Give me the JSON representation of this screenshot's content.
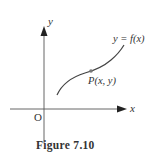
{
  "figure": {
    "caption": "Figure 7.10",
    "axes": {
      "x_label": "x",
      "y_label": "y",
      "origin_label": "O"
    },
    "curve": {
      "label": "y = f(x)"
    },
    "point": {
      "label": "P(x, y)"
    },
    "colors": {
      "axis": "#555555",
      "curve": "#444444",
      "point": "#777777",
      "text": "#333333"
    }
  }
}
